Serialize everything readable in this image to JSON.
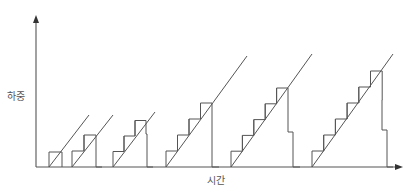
{
  "diagram": {
    "type": "staircase-load-diagram",
    "y_axis_label": "하중",
    "x_axis_label": "시간",
    "colors": {
      "line": "#555555",
      "background": "#ffffff",
      "label": "#555555"
    },
    "axes": {
      "origin": [
        36,
        167
      ],
      "y_top": 15,
      "x_right": 403
    },
    "groups": [
      {
        "name": "group-1",
        "steps": 1,
        "start_x": 49,
        "step_width": 13,
        "step_height": 15,
        "descent": [
          [
            62,
            167
          ]
        ],
        "diagonal_end": [
          89,
          115
        ]
      },
      {
        "name": "group-2",
        "steps": 2,
        "start_x": 72,
        "step_width": 12,
        "step_height": 16,
        "descent": [
          [
            96,
            149
          ],
          [
            102,
            167
          ]
        ],
        "diagonal_end": [
          113,
          115
        ]
      },
      {
        "name": "group-3",
        "steps": 3,
        "start_x": 113,
        "step_width": 11,
        "step_height": 15.5,
        "descent": [
          [
            147,
            134
          ],
          [
            153,
            167
          ]
        ],
        "diagonal_end": [
          155,
          112
        ]
      },
      {
        "name": "group-4",
        "steps": 4,
        "start_x": 166,
        "step_width": 11.5,
        "step_height": 16,
        "descent": [
          [
            212,
            133
          ],
          [
            219,
            167
          ]
        ],
        "diagonal_end": [
          247,
          56
        ]
      },
      {
        "name": "group-5",
        "steps": 5,
        "start_x": 231,
        "step_width": 11.4,
        "step_height": 15.8,
        "descent": [
          [
            288,
            101
          ],
          [
            293,
            132
          ],
          [
            300,
            167
          ]
        ],
        "diagonal_end": [
          312,
          54
        ]
      },
      {
        "name": "group-6",
        "steps": 6,
        "start_x": 312,
        "step_width": 11.7,
        "step_height": 16,
        "descent": [
          [
            382,
            100
          ],
          [
            387,
            130
          ],
          [
            393,
            167
          ]
        ],
        "diagonal_end": [
          393,
          54
        ]
      }
    ]
  }
}
